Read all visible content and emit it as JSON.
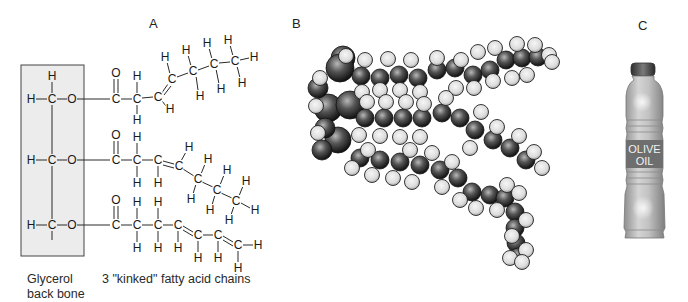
{
  "panels": {
    "a": {
      "label": "A",
      "glycerol_caption_line1": "Glycerol",
      "glycerol_caption_line2": "back bone",
      "chains_caption": "3 \"kinked\" fatty acid chains",
      "box": {
        "x": 21,
        "y": 65,
        "w": 63,
        "h": 191,
        "fill": "#ececec",
        "stroke": "#444444"
      },
      "atoms": [
        {
          "s": "H",
          "x": 52,
          "y": 76
        },
        {
          "s": "H",
          "x": 31,
          "y": 99
        },
        {
          "s": "C",
          "x": 52,
          "y": 99
        },
        {
          "s": "O",
          "x": 72,
          "y": 99
        },
        {
          "s": "H",
          "x": 31,
          "y": 160
        },
        {
          "s": "C",
          "x": 52,
          "y": 160
        },
        {
          "s": "O",
          "x": 72,
          "y": 160
        },
        {
          "s": "H",
          "x": 31,
          "y": 225
        },
        {
          "s": "C",
          "x": 52,
          "y": 225
        },
        {
          "s": "O",
          "x": 72,
          "y": 225
        },
        {
          "s": "O",
          "x": 116,
          "y": 73
        },
        {
          "s": "C",
          "x": 116,
          "y": 99
        },
        {
          "s": "H",
          "x": 137,
          "y": 76
        },
        {
          "s": "C",
          "x": 137,
          "y": 99
        },
        {
          "s": "H",
          "x": 137,
          "y": 120
        },
        {
          "s": "C",
          "x": 158,
          "y": 97
        },
        {
          "s": "H",
          "x": 170,
          "y": 109
        },
        {
          "s": "C",
          "x": 172,
          "y": 79
        },
        {
          "s": "H",
          "x": 165,
          "y": 57
        },
        {
          "s": "C",
          "x": 193,
          "y": 71
        },
        {
          "s": "H",
          "x": 186,
          "y": 50
        },
        {
          "s": "H",
          "x": 200,
          "y": 96
        },
        {
          "s": "C",
          "x": 214,
          "y": 64
        },
        {
          "s": "H",
          "x": 207,
          "y": 43
        },
        {
          "s": "H",
          "x": 221,
          "y": 89
        },
        {
          "s": "C",
          "x": 235,
          "y": 61
        },
        {
          "s": "H",
          "x": 228,
          "y": 40
        },
        {
          "s": "H",
          "x": 242,
          "y": 83
        },
        {
          "s": "H",
          "x": 254,
          "y": 57
        },
        {
          "s": "O",
          "x": 116,
          "y": 135
        },
        {
          "s": "C",
          "x": 116,
          "y": 160
        },
        {
          "s": "H",
          "x": 137,
          "y": 137
        },
        {
          "s": "C",
          "x": 137,
          "y": 160
        },
        {
          "s": "H",
          "x": 137,
          "y": 183
        },
        {
          "s": "C",
          "x": 158,
          "y": 160
        },
        {
          "s": "H",
          "x": 158,
          "y": 183
        },
        {
          "s": "C",
          "x": 179,
          "y": 166
        },
        {
          "s": "H",
          "x": 189,
          "y": 147
        },
        {
          "s": "C",
          "x": 198,
          "y": 179
        },
        {
          "s": "H",
          "x": 208,
          "y": 159
        },
        {
          "s": "H",
          "x": 191,
          "y": 199
        },
        {
          "s": "C",
          "x": 217,
          "y": 190
        },
        {
          "s": "H",
          "x": 227,
          "y": 170
        },
        {
          "s": "H",
          "x": 210,
          "y": 210
        },
        {
          "s": "C",
          "x": 236,
          "y": 201
        },
        {
          "s": "H",
          "x": 246,
          "y": 181
        },
        {
          "s": "H",
          "x": 229,
          "y": 220
        },
        {
          "s": "H",
          "x": 255,
          "y": 210
        },
        {
          "s": "O",
          "x": 116,
          "y": 200
        },
        {
          "s": "C",
          "x": 116,
          "y": 225
        },
        {
          "s": "H",
          "x": 137,
          "y": 202
        },
        {
          "s": "C",
          "x": 137,
          "y": 225
        },
        {
          "s": "H",
          "x": 137,
          "y": 248
        },
        {
          "s": "H",
          "x": 158,
          "y": 202
        },
        {
          "s": "C",
          "x": 158,
          "y": 225
        },
        {
          "s": "H",
          "x": 158,
          "y": 248
        },
        {
          "s": "C",
          "x": 178,
          "y": 225
        },
        {
          "s": "H",
          "x": 178,
          "y": 248
        },
        {
          "s": "C",
          "x": 198,
          "y": 235
        },
        {
          "s": "H",
          "x": 198,
          "y": 258
        },
        {
          "s": "C",
          "x": 218,
          "y": 235
        },
        {
          "s": "H",
          "x": 218,
          "y": 258
        },
        {
          "s": "C",
          "x": 238,
          "y": 245
        },
        {
          "s": "H",
          "x": 258,
          "y": 245
        },
        {
          "s": "H",
          "x": 238,
          "y": 268
        }
      ],
      "bonds": [
        [
          52,
          82,
          52,
          93
        ],
        [
          36,
          99,
          47,
          99
        ],
        [
          57,
          99,
          67,
          99
        ],
        [
          36,
          160,
          47,
          160
        ],
        [
          57,
          160,
          67,
          160
        ],
        [
          36,
          225,
          47,
          225
        ],
        [
          57,
          225,
          67,
          225
        ],
        [
          52,
          105,
          52,
          154
        ],
        [
          52,
          166,
          52,
          219
        ],
        [
          52,
          231,
          52,
          240
        ],
        [
          77,
          99,
          110,
          99
        ],
        [
          77,
          160,
          110,
          160
        ],
        [
          77,
          225,
          110,
          225
        ],
        [
          121,
          99,
          132,
          99
        ],
        [
          137,
          82,
          137,
          93
        ],
        [
          137,
          105,
          137,
          114
        ],
        [
          142,
          98,
          153,
          97
        ],
        [
          161,
          94,
          168,
          84
        ],
        [
          164,
          95,
          171,
          86
        ],
        [
          162,
          101,
          166,
          106
        ],
        [
          170,
          74,
          167,
          62
        ],
        [
          177,
          77,
          188,
          73
        ],
        [
          198,
          70,
          209,
          66
        ],
        [
          219,
          63,
          230,
          62
        ],
        [
          191,
          66,
          188,
          55
        ],
        [
          196,
          76,
          198,
          90
        ],
        [
          212,
          59,
          209,
          48
        ],
        [
          216,
          69,
          219,
          84
        ],
        [
          233,
          56,
          230,
          45
        ],
        [
          237,
          66,
          240,
          78
        ],
        [
          240,
          60,
          249,
          58
        ],
        [
          121,
          160,
          132,
          160
        ],
        [
          137,
          143,
          137,
          154
        ],
        [
          137,
          166,
          137,
          177
        ],
        [
          142,
          160,
          153,
          160
        ],
        [
          158,
          166,
          158,
          177
        ],
        [
          163,
          161,
          174,
          164
        ],
        [
          163,
          165,
          174,
          168
        ],
        [
          181,
          161,
          186,
          152
        ],
        [
          183,
          169,
          194,
          176
        ],
        [
          202,
          182,
          213,
          187
        ],
        [
          221,
          193,
          232,
          198
        ],
        [
          201,
          174,
          205,
          164
        ],
        [
          196,
          184,
          193,
          194
        ],
        [
          220,
          185,
          224,
          175
        ],
        [
          215,
          195,
          212,
          205
        ],
        [
          239,
          196,
          243,
          186
        ],
        [
          234,
          206,
          231,
          215
        ],
        [
          241,
          203,
          250,
          208
        ],
        [
          121,
          225,
          132,
          225
        ],
        [
          137,
          208,
          137,
          219
        ],
        [
          137,
          231,
          137,
          242
        ],
        [
          142,
          225,
          153,
          225
        ],
        [
          158,
          208,
          158,
          219
        ],
        [
          158,
          231,
          158,
          242
        ],
        [
          163,
          225,
          173,
          225
        ],
        [
          178,
          231,
          178,
          242
        ],
        [
          183,
          226,
          193,
          232
        ],
        [
          183,
          230,
          193,
          236
        ],
        [
          198,
          241,
          198,
          252
        ],
        [
          203,
          235,
          213,
          235
        ],
        [
          218,
          241,
          218,
          252
        ],
        [
          223,
          236,
          233,
          242
        ],
        [
          223,
          240,
          233,
          246
        ],
        [
          243,
          245,
          253,
          245
        ],
        [
          238,
          251,
          238,
          262
        ]
      ],
      "carbonyl_double_bonds": [
        [
          114,
          79,
          114,
          93
        ],
        [
          118,
          79,
          118,
          93
        ],
        [
          114,
          141,
          114,
          154
        ],
        [
          118,
          141,
          118,
          154
        ],
        [
          114,
          206,
          114,
          219
        ],
        [
          118,
          206,
          118,
          219
        ]
      ]
    },
    "b": {
      "label": "B",
      "carbon_color": "#3a3a3a",
      "hydrogen_color": "#d9d9d9",
      "spheres": [
        {
          "t": "C",
          "x": 343,
          "y": 58,
          "r": 12
        },
        {
          "t": "C",
          "x": 340,
          "y": 68,
          "r": 14
        },
        {
          "t": "C",
          "x": 328,
          "y": 108,
          "r": 14
        },
        {
          "t": "C",
          "x": 350,
          "y": 105,
          "r": 14
        },
        {
          "t": "C",
          "x": 338,
          "y": 140,
          "r": 13
        },
        {
          "t": "C",
          "x": 325,
          "y": 128,
          "r": 10
        },
        {
          "t": "C",
          "x": 318,
          "y": 88,
          "r": 10
        },
        {
          "t": "C",
          "x": 322,
          "y": 150,
          "r": 10
        },
        {
          "t": "C",
          "x": 361,
          "y": 76,
          "r": 9
        },
        {
          "t": "C",
          "x": 380,
          "y": 78,
          "r": 9
        },
        {
          "t": "C",
          "x": 399,
          "y": 75,
          "r": 9
        },
        {
          "t": "C",
          "x": 418,
          "y": 78,
          "r": 9
        },
        {
          "t": "C",
          "x": 437,
          "y": 70,
          "r": 9
        },
        {
          "t": "C",
          "x": 455,
          "y": 68,
          "r": 9
        },
        {
          "t": "C",
          "x": 473,
          "y": 75,
          "r": 9
        },
        {
          "t": "C",
          "x": 490,
          "y": 70,
          "r": 9
        },
        {
          "t": "C",
          "x": 506,
          "y": 60,
          "r": 9
        },
        {
          "t": "C",
          "x": 522,
          "y": 58,
          "r": 9
        },
        {
          "t": "C",
          "x": 538,
          "y": 57,
          "r": 9
        },
        {
          "t": "C",
          "x": 365,
          "y": 118,
          "r": 9
        },
        {
          "t": "C",
          "x": 384,
          "y": 118,
          "r": 9
        },
        {
          "t": "C",
          "x": 403,
          "y": 118,
          "r": 9
        },
        {
          "t": "C",
          "x": 422,
          "y": 118,
          "r": 9
        },
        {
          "t": "C",
          "x": 442,
          "y": 113,
          "r": 9
        },
        {
          "t": "C",
          "x": 460,
          "y": 118,
          "r": 9
        },
        {
          "t": "C",
          "x": 475,
          "y": 130,
          "r": 9
        },
        {
          "t": "C",
          "x": 493,
          "y": 140,
          "r": 9
        },
        {
          "t": "C",
          "x": 510,
          "y": 148,
          "r": 9
        },
        {
          "t": "C",
          "x": 526,
          "y": 160,
          "r": 9
        },
        {
          "t": "C",
          "x": 360,
          "y": 158,
          "r": 9
        },
        {
          "t": "C",
          "x": 380,
          "y": 160,
          "r": 9
        },
        {
          "t": "C",
          "x": 400,
          "y": 162,
          "r": 9
        },
        {
          "t": "C",
          "x": 420,
          "y": 165,
          "r": 9
        },
        {
          "t": "C",
          "x": 440,
          "y": 170,
          "r": 9
        },
        {
          "t": "C",
          "x": 458,
          "y": 178,
          "r": 9
        },
        {
          "t": "C",
          "x": 472,
          "y": 192,
          "r": 9
        },
        {
          "t": "C",
          "x": 490,
          "y": 195,
          "r": 9
        },
        {
          "t": "C",
          "x": 505,
          "y": 198,
          "r": 9
        },
        {
          "t": "C",
          "x": 515,
          "y": 212,
          "r": 9
        },
        {
          "t": "C",
          "x": 515,
          "y": 228,
          "r": 9
        },
        {
          "t": "C",
          "x": 516,
          "y": 243,
          "r": 9
        },
        {
          "t": "C",
          "x": 518,
          "y": 256,
          "r": 8
        }
      ],
      "hydrogens": [
        [
          320,
          78
        ],
        [
          316,
          106
        ],
        [
          318,
          133
        ],
        [
          346,
          56
        ],
        [
          365,
          60
        ],
        [
          388,
          59
        ],
        [
          411,
          60
        ],
        [
          437,
          58
        ],
        [
          461,
          60
        ],
        [
          478,
          52
        ],
        [
          495,
          48
        ],
        [
          517,
          44
        ],
        [
          535,
          45
        ],
        [
          549,
          55
        ],
        [
          552,
          62
        ],
        [
          362,
          92
        ],
        [
          380,
          90
        ],
        [
          400,
          90
        ],
        [
          420,
          92
        ],
        [
          456,
          88
        ],
        [
          474,
          88
        ],
        [
          493,
          81
        ],
        [
          512,
          78
        ],
        [
          527,
          75
        ],
        [
          367,
          102
        ],
        [
          386,
          102
        ],
        [
          406,
          102
        ],
        [
          424,
          104
        ],
        [
          446,
          98
        ],
        [
          359,
          135
        ],
        [
          380,
          136
        ],
        [
          400,
          137
        ],
        [
          420,
          137
        ],
        [
          470,
          148
        ],
        [
          481,
          112
        ],
        [
          497,
          127
        ],
        [
          519,
          136
        ],
        [
          534,
          152
        ],
        [
          542,
          168
        ],
        [
          352,
          168
        ],
        [
          368,
          150
        ],
        [
          372,
          175
        ],
        [
          393,
          178
        ],
        [
          410,
          150
        ],
        [
          412,
          182
        ],
        [
          432,
          153
        ],
        [
          452,
          162
        ],
        [
          442,
          187
        ],
        [
          460,
          200
        ],
        [
          476,
          208
        ],
        [
          497,
          210
        ],
        [
          507,
          185
        ],
        [
          519,
          193
        ],
        [
          526,
          220
        ],
        [
          512,
          236
        ],
        [
          526,
          250
        ],
        [
          510,
          258
        ],
        [
          522,
          262
        ]
      ]
    },
    "c": {
      "label": "C",
      "bottle_label_line1": "OLIVE",
      "bottle_label_line2": "OIL",
      "cap_color": "#4a4a4a",
      "body_color": "#b8b8b8",
      "label_color": "#6e6e6e"
    }
  }
}
